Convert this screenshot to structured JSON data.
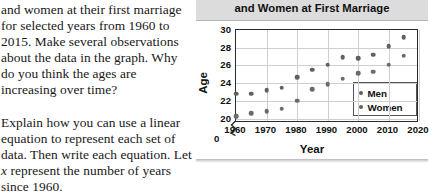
{
  "text_column": {
    "paragraph_1": "and women at their first marriage for selected years from 1960 to 2015. Make several observations about the data in the graph. Why do you think the ages are increasing over time?",
    "paragraph_2_before": "Explain how you can use a linear equation to represent each set of data. Then write each equation. Let ",
    "paragraph_2_italic": "x",
    "paragraph_2_after": " represent the number of years since 1960."
  },
  "panel": {
    "title": "and Women at First Marriage"
  },
  "chart_data": {
    "type": "scatter",
    "title": "and Women at First Marriage",
    "xlabel": "Year",
    "ylabel": "Age",
    "xlim": [
      1960,
      2020
    ],
    "ylim": [
      19.5,
      30
    ],
    "xticks": [
      "1960",
      "1970",
      "1980",
      "1990",
      "2000",
      "2010",
      "2020"
    ],
    "yticks": [
      "20",
      "22",
      "24",
      "26",
      "28",
      "30"
    ],
    "y_origin_label": "0",
    "y_axis_break": true,
    "grid": true,
    "legend_position": "inside-bottom-right",
    "x": [
      1960,
      1965,
      1970,
      1975,
      1980,
      1985,
      1990,
      1995,
      2000,
      2005,
      2010,
      2015
    ],
    "series": [
      {
        "name": "Men",
        "color": "#606060",
        "values": [
          22.8,
          22.8,
          23.2,
          23.5,
          24.7,
          25.5,
          26.1,
          26.9,
          26.8,
          27.2,
          28.2,
          29.2
        ]
      },
      {
        "name": "Women",
        "color": "#6a6a6a",
        "values": [
          20.3,
          20.6,
          20.8,
          21.1,
          22.0,
          23.3,
          23.9,
          24.5,
          25.1,
          25.3,
          26.1,
          27.1
        ]
      }
    ]
  }
}
